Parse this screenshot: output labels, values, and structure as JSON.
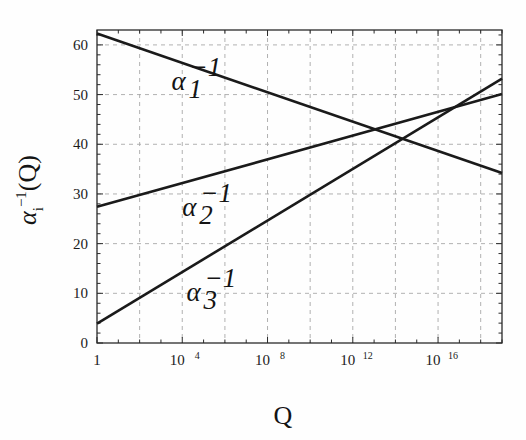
{
  "chart_data": {
    "type": "line",
    "title": "",
    "xlabel": "Q",
    "ylabel": "αᵢ⁻¹(Q)",
    "xscale": "log",
    "xlim": [
      1,
      1e+19
    ],
    "ylim": [
      0,
      63
    ],
    "xticks": [
      "1",
      "10^4",
      "10^8",
      "10^12",
      "10^16"
    ],
    "xtick_values": [
      1,
      10000,
      100000000,
      1000000000000,
      10000000000000000
    ],
    "xtick_mantissa": [
      "1",
      "10",
      "10",
      "10",
      "10"
    ],
    "xtick_exponent": [
      "",
      "4",
      "8",
      "12",
      "16"
    ],
    "yticks": [
      "0",
      "10",
      "20",
      "30",
      "40",
      "50",
      "60"
    ],
    "ytick_values": [
      0,
      10,
      20,
      30,
      40,
      50,
      60
    ],
    "grid": true,
    "grid_style": "dashed",
    "grid_color": "#a8a8a8",
    "legend_position": "inline-labels",
    "line_color": "#1a1a1a",
    "series": [
      {
        "name": "α₁⁻¹",
        "label_base": "α",
        "label_sub": "1",
        "label_sup": "−1",
        "label_x_log10": 3.5,
        "label_y": 51,
        "x_log10": [
          0,
          19
        ],
        "values": [
          62.3,
          34.2
        ],
        "slope_per_decade": -1.48
      },
      {
        "name": "α₂⁻¹",
        "label_base": "α",
        "label_sub": "2",
        "label_sup": "−1",
        "label_x_log10": 4.0,
        "label_y": 25.5,
        "x_log10": [
          0,
          19
        ],
        "values": [
          27.4,
          50.1
        ],
        "slope_per_decade": 1.195
      },
      {
        "name": "α₃⁻¹",
        "label_base": "α",
        "label_sub": "3",
        "label_sup": "−1",
        "label_x_log10": 4.2,
        "label_y": 8.5,
        "x_log10": [
          0,
          19
        ],
        "values": [
          3.9,
          53.2
        ],
        "slope_per_decade": 2.595
      }
    ],
    "crossings": [
      {
        "between": "α₁⁻¹ and α₂⁻¹",
        "x_log10": 13.1,
        "y": 43.0
      },
      {
        "between": "α₁⁻¹ and α₃⁻¹",
        "x_log10": 14.6,
        "y": 40.7
      },
      {
        "between": "α₂⁻¹ and α₃⁻¹",
        "x_log10": 16.8,
        "y": 47.5
      }
    ]
  },
  "axes": {
    "y_label_alpha": "α",
    "y_label_sub": "i",
    "y_label_sup": "−1",
    "y_label_tail": "(Q)",
    "x_label": "Q"
  }
}
